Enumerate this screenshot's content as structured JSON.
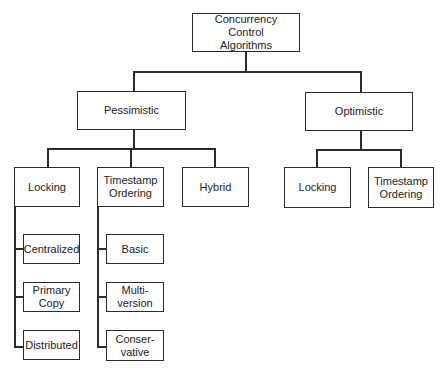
{
  "diagram": {
    "title": "Concurrency Control Algorithms",
    "root": {
      "label": "Concurrency\nControl\nAlgorithms"
    },
    "pessimistic": {
      "label": "Pessimistic",
      "children": {
        "locking": {
          "label": "Locking",
          "children": [
            "Centralized",
            "Primary\nCopy",
            "Distributed"
          ]
        },
        "timestamp": {
          "label": "Timestamp\nOrdering",
          "children": [
            "Basic",
            "Multi-\nversion",
            "Conser-\nvative"
          ]
        },
        "hybrid": {
          "label": "Hybrid"
        }
      }
    },
    "optimistic": {
      "label": "Optimistic",
      "children": {
        "locking": {
          "label": "Locking"
        },
        "timestamp": {
          "label": "Timestamp\nOrdering"
        }
      }
    },
    "colors": {
      "line": "#2b2b2b",
      "box_border": "#2b2b2b",
      "background": "#ffffff",
      "text": "#222222"
    }
  }
}
